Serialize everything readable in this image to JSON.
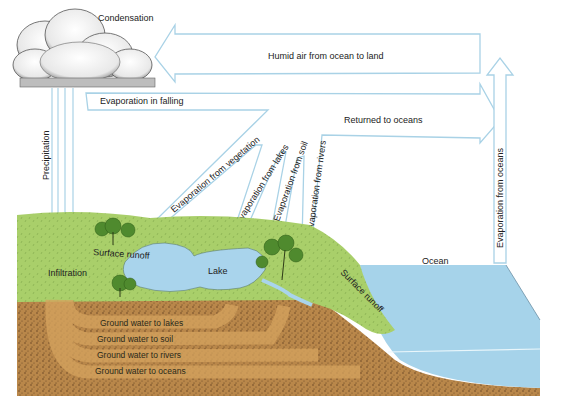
{
  "diagram": {
    "type": "hydrologic-cycle",
    "colors": {
      "arrow_outline": "#a9d2e6",
      "ocean": "#a6d3ea",
      "lake": "#a9d4ec",
      "land_green": "#a9cf6a",
      "soil": "#b9874a",
      "soil_dark": "#6e4a28",
      "groundwater_band": "#d6a45f",
      "cloud": "#f2f2f2"
    },
    "labels": {
      "condensation": "Condensation",
      "humid_air": "Humid air from ocean to land",
      "evap_falling": "Evaporation in falling",
      "returned_oceans": "Returned to oceans",
      "evap_oceans": "Evaporation from oceans",
      "precipitation": "Precipitation",
      "evap_vegetation": "Evaporation from vegetation",
      "evap_lakes": "Evaporation from lakes",
      "evap_soil": "Evaporation from soil",
      "evap_rivers": "Evaporation from rivers",
      "surface_runoff_left": "Surface runoff",
      "surface_runoff_right": "Surface runoff",
      "infiltration": "Infiltration",
      "lake": "Lake",
      "ocean": "Ocean",
      "gw_lakes": "Ground water to lakes",
      "gw_soil": "Ground water to soil",
      "gw_rivers": "Ground water to rivers",
      "gw_oceans": "Ground water to oceans"
    }
  }
}
